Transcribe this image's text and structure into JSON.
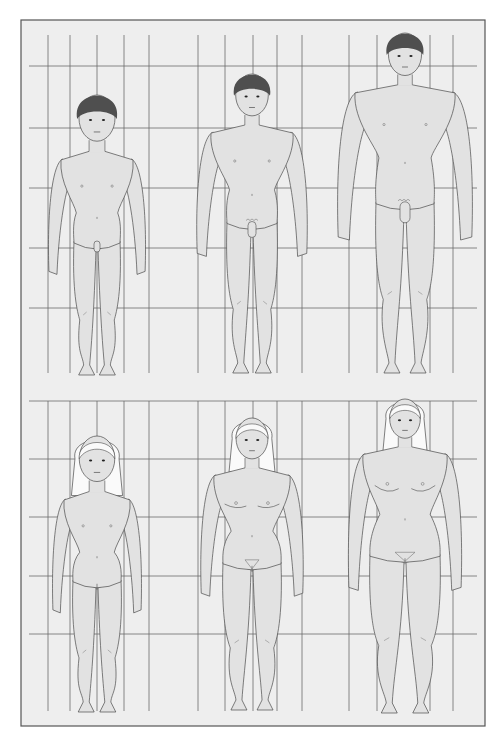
{
  "canvas": {
    "width": 500,
    "height": 744,
    "background": "#ffffff"
  },
  "frame": {
    "x": 21,
    "y": 20,
    "width": 464,
    "height": 706,
    "fill": "#eeeeee",
    "stroke": "#555555"
  },
  "colors": {
    "grid": "#6a6a6a",
    "skin": "#e2e2e2",
    "outline": "#4a4a4a",
    "hair_dark": "#4f4f4f",
    "hair_light": "#fafafa",
    "detail": "#777777"
  },
  "grid": {
    "vertical_x": [
      48,
      70,
      97,
      124,
      149,
      198,
      225,
      253,
      277,
      302,
      349,
      377,
      430,
      453
    ],
    "sections": [
      {
        "name": "male-row",
        "top": 35,
        "bottom": 373,
        "horizontal_y": [
          66,
          128,
          188,
          248,
          308
        ],
        "h_left": 29,
        "h_right": 477
      },
      {
        "name": "female-row",
        "top": 401,
        "bottom": 711,
        "horizontal_y": [
          401,
          459,
          517,
          576,
          634
        ],
        "h_left": 29,
        "h_right": 477
      }
    ]
  },
  "figures": [
    {
      "id": "boy-child",
      "row": "male-row",
      "sex": "male",
      "stage": 1,
      "cx": 97,
      "head_top": 95,
      "feet": 375,
      "shoulder_w": 72,
      "hip_w": 46,
      "hair": "dark",
      "breasts": 0,
      "pubic": 0
    },
    {
      "id": "boy-adolescent",
      "row": "male-row",
      "sex": "male",
      "stage": 2,
      "cx": 252,
      "head_top": 74,
      "feet": 373,
      "shoulder_w": 82,
      "hip_w": 50,
      "hair": "dark",
      "breasts": 0,
      "pubic": 1
    },
    {
      "id": "man-adult",
      "row": "male-row",
      "sex": "male",
      "stage": 3,
      "cx": 405,
      "head_top": 33,
      "feet": 373,
      "shoulder_w": 100,
      "hip_w": 58,
      "hair": "dark",
      "breasts": 0,
      "pubic": 2
    },
    {
      "id": "girl-child",
      "row": "female-row",
      "sex": "female",
      "stage": 1,
      "cx": 97,
      "head_top": 436,
      "feet": 712,
      "shoulder_w": 66,
      "hip_w": 48,
      "hair": "light",
      "breasts": 0,
      "pubic": 0
    },
    {
      "id": "girl-adolescent",
      "row": "female-row",
      "sex": "female",
      "stage": 2,
      "cx": 252,
      "head_top": 418,
      "feet": 710,
      "shoulder_w": 76,
      "hip_w": 58,
      "hair": "light",
      "breasts": 1,
      "pubic": 1
    },
    {
      "id": "woman-adult",
      "row": "female-row",
      "sex": "female",
      "stage": 3,
      "cx": 405,
      "head_top": 399,
      "feet": 713,
      "shoulder_w": 84,
      "hip_w": 70,
      "hair": "light",
      "breasts": 2,
      "pubic": 2
    }
  ]
}
